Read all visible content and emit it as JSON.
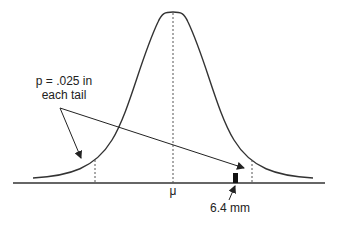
{
  "diagram": {
    "type": "normal-distribution",
    "mean_label": "μ",
    "tail_label_line1": "p = .025 in",
    "tail_label_line2": "each tail",
    "marker_label": "6.4 mm",
    "colors": {
      "curve": "#333333",
      "axis": "#333333",
      "marker": "#111111",
      "dashed": "#555555"
    }
  }
}
